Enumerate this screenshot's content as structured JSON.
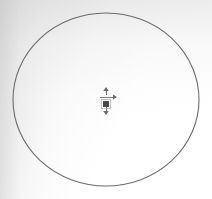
{
  "canvas": {
    "width": 212,
    "height": 199,
    "background_color": "#ffffff",
    "shading_color": "#c9c9c9",
    "label": "drawing-canvas"
  },
  "shapes": {
    "circle": {
      "name": "circle-outline",
      "center_x": 106,
      "center_y": 99.5,
      "radius_x": 93,
      "radius_y": 86.5,
      "stroke_color": "#6b6b6b",
      "stroke_width": 1.1,
      "fill": "none"
    },
    "center_marker": {
      "name": "center-point-marker",
      "x": 106,
      "y": 104,
      "square_size": 6,
      "square_color": "#4a4a4a",
      "handle_color": "#6d6d6d",
      "arm_up_length": 9,
      "arm_down_length": 9,
      "arm_right_length": 8,
      "arm_left_length": 3
    }
  },
  "accent": {
    "stroke": "#6b6b6b",
    "marker": "#4a4a4a"
  }
}
